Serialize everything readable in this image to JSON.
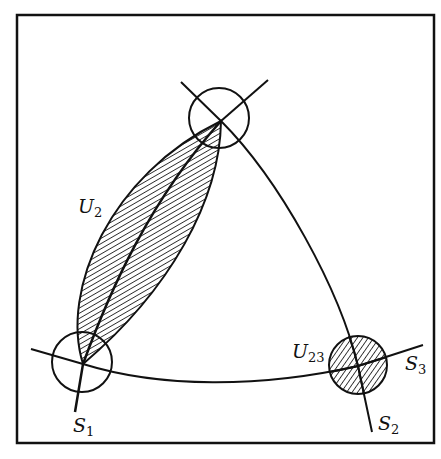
{
  "figure": {
    "background": "#ffffff",
    "ink_color": "#111111",
    "frame": {
      "x": 17,
      "y": 15,
      "width": 417,
      "height": 428
    }
  },
  "labels": {
    "u2": {
      "main": "U",
      "sub": "2"
    },
    "u23": {
      "main": "U",
      "sub": "23"
    },
    "s1": {
      "main": "S",
      "sub": "1"
    },
    "s2": {
      "main": "S",
      "sub": "2"
    },
    "s3": {
      "main": "S",
      "sub": "3"
    }
  },
  "nodes": [
    {
      "name": "top-vertex",
      "cx": 219,
      "cy": 118,
      "r": 30,
      "hatched": false
    },
    {
      "name": "bottom-left-vertex",
      "cx": 82,
      "cy": 362,
      "r": 30,
      "hatched": false
    },
    {
      "name": "bottom-right-vertex",
      "cx": 358,
      "cy": 365,
      "r": 29,
      "hatched": true
    }
  ],
  "regions": [
    {
      "name": "U2",
      "shape": "lens",
      "hatched": true
    },
    {
      "name": "U23",
      "shape": "disc",
      "hatched": true
    }
  ]
}
